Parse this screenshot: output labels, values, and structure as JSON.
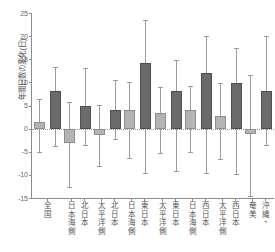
{
  "chart_data": {
    "type": "bar",
    "title": "",
    "xlabel": "",
    "ylabel": "年間日数の変化(日)",
    "ylim": [
      -15,
      25
    ],
    "yticks": [
      -15,
      -10,
      -5,
      0,
      5,
      10,
      15,
      20,
      25
    ],
    "ytick_labels": [
      "-15",
      "-10",
      "-5",
      "0",
      "5",
      "10",
      "15",
      "20",
      "25"
    ],
    "grid": false,
    "legend": "none",
    "zero_line": 0,
    "categories": [
      "全国",
      "北日本日本海側",
      "北日本太平洋側",
      "東日本日本海側",
      "東日本太平洋側",
      "西日本日本海側",
      "西日本太平洋側",
      "沖縄・奄美"
    ],
    "category_columns": [
      [
        "全国"
      ],
      [
        "日本海側",
        "北日本"
      ],
      [
        "太平洋側",
        "北日本"
      ],
      [
        "日本海側",
        "東日本"
      ],
      [
        "太平洋側",
        "東日本"
      ],
      [
        "日本海側",
        "西日本"
      ],
      [
        "太平洋側",
        "西日本"
      ],
      [
        "奄美",
        "沖縄・"
      ]
    ],
    "series": [
      {
        "name": "light",
        "color": "#b4b4b4",
        "values": [
          1.5,
          -3.2,
          -1.4,
          4.0,
          3.3,
          4.1,
          2.7,
          -1.2
        ],
        "err_low": [
          -5.0,
          -12.7,
          -8.1,
          -6.3,
          -5.2,
          -5.1,
          -6.6,
          -14.6
        ],
        "err_high": [
          6.4,
          5.8,
          5.2,
          10.0,
          9.0,
          9.3,
          9.8,
          11.6
        ]
      },
      {
        "name": "dark",
        "color": "#6b6b6b",
        "values": [
          8.1,
          4.8,
          4.0,
          14.2,
          8.1,
          12.1,
          9.9,
          8.1
        ],
        "err_low": [
          -3.8,
          -3.5,
          -2.2,
          -9.5,
          -9.1,
          -9.6,
          -9.9,
          -3.6
        ],
        "err_high": [
          13.3,
          13.1,
          10.6,
          23.4,
          14.8,
          20.1,
          17.5,
          20.0
        ]
      }
    ]
  }
}
